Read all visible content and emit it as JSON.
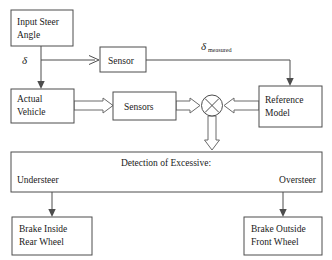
{
  "diagram": {
    "background_color": "#ffffff",
    "line_color": "#4d4d4d",
    "text_color": "#1a1a1a",
    "blocks": {
      "input_steer_angle": {
        "line1": "Input Steer",
        "line2": "Angle"
      },
      "sensor": {
        "label": "Sensor"
      },
      "actual_vehicle": {
        "line1": "Actual",
        "line2": "Vehicle"
      },
      "sensors": {
        "label": "Sensors"
      },
      "reference_model": {
        "line1": "Reference",
        "line2": "Model"
      },
      "detection": {
        "title": "Detection of Excessive:",
        "left_label": "Understeer",
        "right_label": "Oversteer"
      },
      "brake_inside": {
        "line1": "Brake Inside",
        "line2": "Rear Wheel"
      },
      "brake_outside": {
        "line1": "Brake Outside",
        "line2": "Front Wheel"
      }
    },
    "signals": {
      "delta": "δ",
      "delta_measured_symbol": "δ",
      "delta_measured_subscript": "measured"
    },
    "junction": {
      "name": "summing-junction",
      "marking": "x"
    }
  }
}
